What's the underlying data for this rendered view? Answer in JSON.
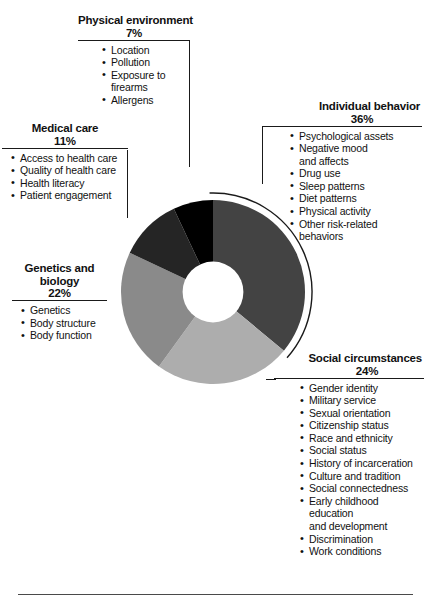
{
  "chart_data": {
    "type": "pie",
    "variant": "donut",
    "title": "",
    "categories": [
      "Individual behavior",
      "Social circumstances",
      "Genetics and biology",
      "Medical care",
      "Physical environment"
    ],
    "values": [
      36,
      24,
      22,
      11,
      7
    ],
    "value_unit": "%",
    "value_labels": [
      "36%",
      "24%",
      "22%",
      "11%",
      "7%"
    ],
    "colors": [
      "#434343",
      "#adadad",
      "#8a8a8a",
      "#252525",
      "#000000"
    ],
    "start_angle_deg": 0,
    "direction": "clockwise",
    "inner_radius_ratio": 0.33,
    "legend": "callout-labels",
    "grid": false,
    "ylim": [
      0,
      100
    ]
  },
  "segments": {
    "physical_environment": {
      "title": "Physical environment",
      "percent": "7%",
      "color": "#000000",
      "items": [
        "Location",
        "Pollution",
        "Exposure to firearms",
        "Allergens"
      ]
    },
    "medical_care": {
      "title": "Medical care",
      "percent": "11%",
      "color": "#252525",
      "items": [
        "Access to health care",
        "Quality of health care",
        "Health literacy",
        "Patient engagement"
      ]
    },
    "genetics_and_biology": {
      "title_line1": "Genetics and",
      "title_line2": "biology",
      "percent": "22%",
      "color": "#8a8a8a",
      "items": [
        "Genetics",
        "Body structure",
        "Body function"
      ]
    },
    "individual_behavior": {
      "title": "Individual behavior",
      "percent": "36%",
      "color": "#434343",
      "items": [
        "Psychological assets",
        "Negative mood",
        "and affects",
        "Drug use",
        "Sleep patterns",
        "Diet patterns",
        "Physical activity",
        "Other risk-related",
        "behaviors"
      ],
      "continuation_indexes": [
        2,
        8
      ]
    },
    "social_circumstances": {
      "title": "Social circumstances",
      "percent": "24%",
      "color": "#adadad",
      "items": [
        "Gender identity",
        "Military service",
        "Sexual orientation",
        "Citizenship status",
        "Race and ethnicity",
        "Social status",
        "History of incarceration",
        "Culture and tradition",
        "Social connectedness",
        "Early childhood education",
        "and development",
        "Discrimination",
        "Work conditions"
      ],
      "continuation_indexes": [
        10
      ]
    }
  }
}
